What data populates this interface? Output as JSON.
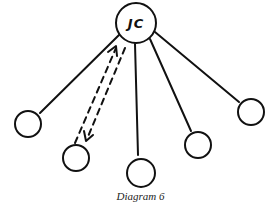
{
  "diagram": {
    "center_node": {
      "label": "JC",
      "cx": 136,
      "cy": 23,
      "r": 20
    },
    "outer_nodes": [
      {
        "id": "node-1",
        "cx": 28,
        "cy": 124,
        "r": 13
      },
      {
        "id": "node-2",
        "cx": 76,
        "cy": 158,
        "r": 13
      },
      {
        "id": "node-3",
        "cx": 141,
        "cy": 173,
        "r": 14
      },
      {
        "id": "node-4",
        "cx": 198,
        "cy": 145,
        "r": 13
      },
      {
        "id": "node-5",
        "cx": 251,
        "cy": 112,
        "r": 13
      }
    ],
    "edges": [
      {
        "from": "JC",
        "to": "node-1",
        "style": "solid"
      },
      {
        "from": "JC",
        "to": "node-2",
        "style": "dashed-bidirectional"
      },
      {
        "from": "JC",
        "to": "node-3",
        "style": "solid"
      },
      {
        "from": "JC",
        "to": "node-4",
        "style": "solid"
      },
      {
        "from": "JC",
        "to": "node-5",
        "style": "solid"
      }
    ],
    "caption": "Diagram 6",
    "stroke_color": "#111111"
  }
}
